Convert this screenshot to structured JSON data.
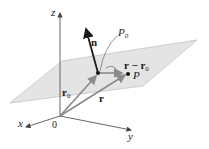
{
  "diagram": {
    "type": "vector-plane-3d",
    "axes": {
      "x_label": "x",
      "y_label": "y",
      "z_label": "z",
      "origin_label": "0"
    },
    "vectors": {
      "normal": {
        "label": "n"
      },
      "r0": {
        "label": "r",
        "sub": "0"
      },
      "r": {
        "label": "r"
      },
      "diff": {
        "label": "r − r",
        "sub": "0"
      }
    },
    "points": {
      "p0": {
        "label": "P",
        "sub": "0"
      },
      "p": {
        "label": "P"
      }
    },
    "colors": {
      "plane_fill": "#e4e4e4",
      "plane_edge": "#bdbdbd",
      "axis": "#555555",
      "vector_gray": "#8a8a8a",
      "normal": "#1a1a1a"
    }
  }
}
